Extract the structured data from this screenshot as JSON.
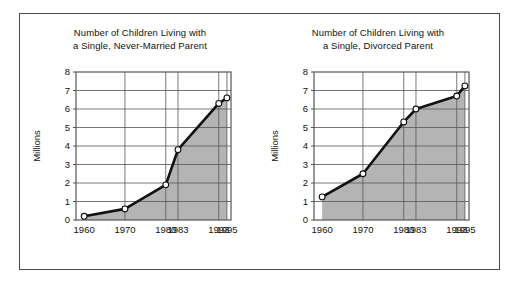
{
  "figure": {
    "background_color": "#ffffff",
    "frame_color": "#4a4a4a",
    "panels": [
      "left",
      "right"
    ]
  },
  "style": {
    "fill_color": "#b4b4b4",
    "line_color": "#111111",
    "grid_color": "#555555",
    "axis_color": "#555555",
    "marker_fill": "#ffffff"
  },
  "chart_data": [
    {
      "id": "never-married",
      "type": "area",
      "title": "Number of Children Living with a Single, Never-Married Parent",
      "title_line1": "Number of Children Living with",
      "title_line2": "a Single, Never-Married Parent",
      "xlabel": "",
      "ylabel": "Millions",
      "categories": [
        "1960",
        "1970",
        "1980",
        "1983",
        "1993",
        "1995"
      ],
      "x": [
        1960,
        1970,
        1980,
        1983,
        1993,
        1995
      ],
      "values": [
        0.2,
        0.6,
        1.9,
        3.8,
        6.3,
        6.6
      ],
      "xlim": [
        1958,
        1996
      ],
      "ylim": [
        0,
        8
      ],
      "yticks": [
        0,
        1,
        2,
        3,
        4,
        5,
        6,
        7,
        8
      ],
      "ytick_labels": [
        "0",
        "1",
        "2",
        "3",
        "4",
        "5",
        "6",
        "7",
        "8"
      ],
      "xticks": [
        1960,
        1970,
        1980,
        1983,
        1993,
        1995
      ],
      "xtick_labels": [
        "1960",
        "1970",
        "1980",
        "1983",
        "1993",
        "1995"
      ],
      "grid": true,
      "legend": "none",
      "markers": "open-circle"
    },
    {
      "id": "divorced",
      "type": "area",
      "title": "Number of Children Living with a Single, Divorced Parent",
      "title_line1": "Number of Children Living with",
      "title_line2": "a Single, Divorced Parent",
      "xlabel": "",
      "ylabel": "Millions",
      "categories": [
        "1960",
        "1970",
        "1980",
        "1983",
        "1993",
        "1995"
      ],
      "x": [
        1960,
        1970,
        1980,
        1983,
        1993,
        1995
      ],
      "values": [
        1.25,
        2.5,
        5.3,
        6.0,
        6.7,
        7.25
      ],
      "xlim": [
        1958,
        1996
      ],
      "ylim": [
        0,
        8
      ],
      "yticks": [
        0,
        1,
        2,
        3,
        4,
        5,
        6,
        7,
        8
      ],
      "ytick_labels": [
        "0",
        "1",
        "2",
        "3",
        "4",
        "5",
        "6",
        "7",
        "8"
      ],
      "xticks": [
        1960,
        1970,
        1980,
        1983,
        1993,
        1995
      ],
      "xtick_labels": [
        "1960",
        "1970",
        "1980",
        "1983",
        "1993",
        "1995"
      ],
      "grid": true,
      "legend": "none",
      "markers": "open-circle"
    }
  ]
}
